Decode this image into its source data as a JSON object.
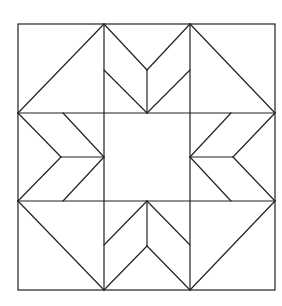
{
  "diagram": {
    "title": "",
    "type": "quilt-block-star",
    "stroke_color": "#222222",
    "background": "#ffffff",
    "outer_square": {
      "x": 18,
      "y": 24,
      "width": 257,
      "height": 266
    },
    "grid": {
      "cols_x": [
        18,
        104,
        190,
        275
      ],
      "rows_y": [
        24,
        113,
        201,
        290
      ]
    },
    "segments": [
      {
        "cell": "top-left",
        "x1": 18,
        "y1": 113,
        "x2": 104,
        "y2": 24
      },
      {
        "cell": "top-middle",
        "x1": 104,
        "y1": 24,
        "x2": 147,
        "y2": 70
      },
      {
        "cell": "top-middle",
        "x1": 190,
        "y1": 24,
        "x2": 147,
        "y2": 70
      },
      {
        "cell": "top-middle",
        "x1": 147,
        "y1": 70,
        "x2": 147,
        "y2": 113
      },
      {
        "cell": "top-middle",
        "x1": 104,
        "y1": 70,
        "x2": 147,
        "y2": 113
      },
      {
        "cell": "top-middle",
        "x1": 190,
        "y1": 70,
        "x2": 147,
        "y2": 113
      },
      {
        "cell": "top-right",
        "x1": 190,
        "y1": 24,
        "x2": 275,
        "y2": 113
      },
      {
        "cell": "middle-left",
        "x1": 18,
        "y1": 113,
        "x2": 61,
        "y2": 157
      },
      {
        "cell": "middle-left",
        "x1": 61,
        "y1": 157,
        "x2": 104,
        "y2": 157
      },
      {
        "cell": "middle-left",
        "x1": 18,
        "y1": 201,
        "x2": 61,
        "y2": 157
      },
      {
        "cell": "middle-left",
        "x1": 63,
        "y1": 113,
        "x2": 104,
        "y2": 157
      },
      {
        "cell": "middle-left",
        "x1": 63,
        "y1": 201,
        "x2": 104,
        "y2": 157
      },
      {
        "cell": "middle-right",
        "x1": 275,
        "y1": 113,
        "x2": 233,
        "y2": 157
      },
      {
        "cell": "middle-right",
        "x1": 233,
        "y1": 157,
        "x2": 190,
        "y2": 157
      },
      {
        "cell": "middle-right",
        "x1": 275,
        "y1": 201,
        "x2": 233,
        "y2": 157
      },
      {
        "cell": "middle-right",
        "x1": 231,
        "y1": 113,
        "x2": 190,
        "y2": 157
      },
      {
        "cell": "middle-right",
        "x1": 231,
        "y1": 201,
        "x2": 190,
        "y2": 157
      },
      {
        "cell": "bottom-left",
        "x1": 18,
        "y1": 201,
        "x2": 104,
        "y2": 290
      },
      {
        "cell": "bottom-middle",
        "x1": 147,
        "y1": 201,
        "x2": 104,
        "y2": 245
      },
      {
        "cell": "bottom-middle",
        "x1": 147,
        "y1": 201,
        "x2": 190,
        "y2": 245
      },
      {
        "cell": "bottom-middle",
        "x1": 147,
        "y1": 201,
        "x2": 147,
        "y2": 246
      },
      {
        "cell": "bottom-middle",
        "x1": 147,
        "y1": 246,
        "x2": 104,
        "y2": 290
      },
      {
        "cell": "bottom-middle",
        "x1": 147,
        "y1": 246,
        "x2": 190,
        "y2": 290
      },
      {
        "cell": "bottom-right",
        "x1": 275,
        "y1": 201,
        "x2": 190,
        "y2": 290
      }
    ]
  }
}
